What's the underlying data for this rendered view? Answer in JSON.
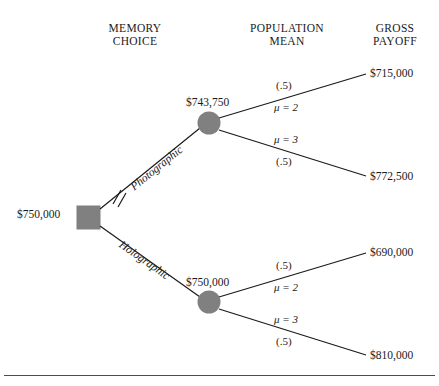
{
  "headers": [
    {
      "line1": "MEMORY",
      "line2": "CHOICE"
    },
    {
      "line1": "POPULATION",
      "line2": "MEAN"
    },
    {
      "line1": "GROSS",
      "line2": "PAYOFF"
    }
  ],
  "root": {
    "value": "$750,000"
  },
  "branches": [
    {
      "label": "Photographic",
      "pruned": true,
      "node_value": "$743,750",
      "outcomes": [
        {
          "prob": "(.5)",
          "mean": "μ = 2",
          "payoff": "$715,000"
        },
        {
          "prob": "(.5)",
          "mean": "μ = 3",
          "payoff": "$772,500"
        }
      ]
    },
    {
      "label": "Holographic",
      "pruned": false,
      "node_value": "$750,000",
      "outcomes": [
        {
          "prob": "(.5)",
          "mean": "μ = 2",
          "payoff": "$690,000"
        },
        {
          "prob": "(.5)",
          "mean": "μ = 3",
          "payoff": "$810,000"
        }
      ]
    }
  ],
  "colors": {
    "node_fill": "#808080",
    "line": "#1a1a1a",
    "text": "#1a1a1a",
    "rule": "#4d4d4d"
  }
}
